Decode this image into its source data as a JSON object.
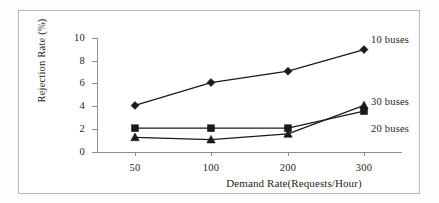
{
  "chart_data": {
    "type": "line",
    "title": "",
    "xlabel": "Demand Rate(Requests/Hour)",
    "ylabel": "Rejection Rate (%)",
    "categories": [
      "50",
      "100",
      "200",
      "300"
    ],
    "ylim": [
      0,
      10
    ],
    "yticks": [
      "0",
      "2",
      "4",
      "6",
      "8",
      "10"
    ],
    "grid": false,
    "legend_position": "right-inline-annotations",
    "series": [
      {
        "name": "10 buses",
        "marker": "diamond",
        "color": "#1a1a1a",
        "values": [
          4.0,
          6.0,
          7.0,
          8.9
        ]
      },
      {
        "name": "20 buses",
        "marker": "square",
        "color": "#1a1a1a",
        "values": [
          2.0,
          2.0,
          2.0,
          3.5
        ]
      },
      {
        "name": "30 buses",
        "marker": "triangle",
        "color": "#1a1a1a",
        "values": [
          1.2,
          1.0,
          1.5,
          4.0
        ]
      }
    ],
    "annotations": [
      {
        "text": "10 buses",
        "series": "10 buses"
      },
      {
        "text": "30 buses",
        "series": "30 buses"
      },
      {
        "text": "20 buses",
        "series": "20 buses"
      }
    ]
  },
  "colors": {
    "ink": "#231f20",
    "axis": "#8d8d8d",
    "frame": "#b9b9b9",
    "marker": "#1a1a1a",
    "background": "#ffffff"
  }
}
